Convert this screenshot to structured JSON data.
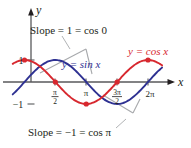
{
  "figure": {
    "axes": {
      "y_axis_label": "y",
      "x_axis_label": "x",
      "y_tick_positive": "1",
      "y_tick_negative": "−1",
      "x_ticks": [
        {
          "id": "pi-over-2",
          "numerator": "π",
          "denominator": "2",
          "value": 1.5707963
        },
        {
          "id": "pi",
          "text": "π",
          "value": 3.1415927
        },
        {
          "id": "three-pi-over-2",
          "numerator": "3π",
          "denominator": "2",
          "value": 4.712389
        },
        {
          "id": "two-pi",
          "text": "2π",
          "value": 6.2831853
        }
      ]
    },
    "curve_labels": {
      "sine": "y = sin x",
      "cosine": "y = cos x"
    },
    "annotations": {
      "top": "Slope = 1 = cos 0",
      "bottom": "Slope = −1 = cos π"
    },
    "colors": {
      "sine": "#2e3192",
      "cosine": "#d7282f",
      "axis": "#58595b",
      "tangent": "#a7a9ac",
      "point": "#d7282f",
      "text": "#231f20"
    }
  },
  "chart_data": {
    "type": "line",
    "xlabel": "x",
    "ylabel": "y",
    "xlim": [
      -0.6,
      7.0
    ],
    "ylim": [
      -1.45,
      1.45
    ],
    "grid": false,
    "legend": "inline-curve-labels",
    "xticks": [
      1.5707963,
      3.1415927,
      4.712389,
      6.2831853
    ],
    "xticklabels": [
      "π/2",
      "π",
      "3π/2",
      "2π"
    ],
    "yticks": [
      -1,
      1
    ],
    "yticklabels": [
      "−1",
      "1"
    ],
    "series": [
      {
        "name": "y = sin x",
        "color": "#2e3192",
        "x": [
          -0.6,
          0,
          0.5235988,
          1.0471976,
          1.5707963,
          2.0943951,
          2.6179939,
          3.1415927,
          3.6651914,
          4.1887902,
          4.712389,
          5.2359878,
          5.7595865,
          6.2831853,
          6.8
        ],
        "y": [
          -0.5646,
          0,
          0.5,
          0.866,
          1,
          0.866,
          0.5,
          0,
          -0.5,
          -0.866,
          -1,
          -0.866,
          -0.5,
          0,
          0.5646
        ]
      },
      {
        "name": "y = cos x",
        "color": "#d7282f",
        "x": [
          -0.6,
          0,
          0.5235988,
          1.0471976,
          1.5707963,
          2.0943951,
          2.6179939,
          3.1415927,
          3.6651914,
          4.1887902,
          4.712389,
          5.2359878,
          5.7595865,
          6.2831853,
          6.8
        ],
        "y": [
          0.8253,
          1,
          0.866,
          0.5,
          0,
          -0.5,
          -0.866,
          -1,
          -0.866,
          -0.5,
          0,
          0.5,
          0.866,
          1,
          0.8253
        ]
      }
    ],
    "marked_points": [
      {
        "x": 0,
        "y": 1,
        "on": "y = cos x"
      },
      {
        "x": 1.5707963,
        "y": 0,
        "on": "y = cos x"
      },
      {
        "x": 3.1415927,
        "y": -1,
        "on": "y = cos x"
      },
      {
        "x": 4.712389,
        "y": 0,
        "on": "y = cos x"
      },
      {
        "x": 6.2831853,
        "y": 1,
        "on": "y = cos x"
      }
    ],
    "tangent_lines": [
      {
        "at_x": 0,
        "slope": 1,
        "label": "Slope = 1 = cos 0",
        "on": "y = sin x"
      },
      {
        "at_x": 3.1415927,
        "slope": -1,
        "label": "Slope = −1 = cos π",
        "on": "y = sin x"
      }
    ],
    "annotations": [
      "Slope = 1 = cos 0",
      "Slope = −1 = cos π"
    ]
  }
}
